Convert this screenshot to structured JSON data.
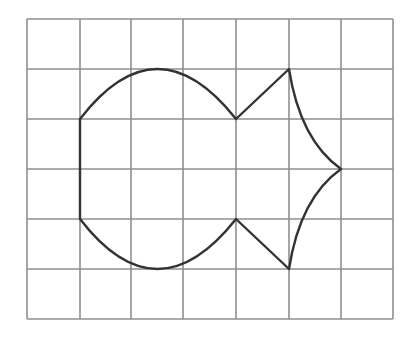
{
  "diagram": {
    "type": "grid-figure",
    "grid": {
      "columns": 7,
      "rows": 6,
      "x_lines": [
        27,
        80,
        131,
        183,
        236,
        289,
        341,
        393
      ],
      "y_lines": [
        19,
        69,
        119,
        169,
        219,
        269,
        319
      ],
      "line_color": "#8f8f8f"
    },
    "figure": {
      "description": "Fish-like closed shape drawn on a square grid",
      "stroke_color": "#333333",
      "path": "M80,119 Q157,19 236,119 L289,69 Q300,140 341,169 Q300,198 289,269 L236,219 Q157,319 80,219 Z"
    }
  }
}
